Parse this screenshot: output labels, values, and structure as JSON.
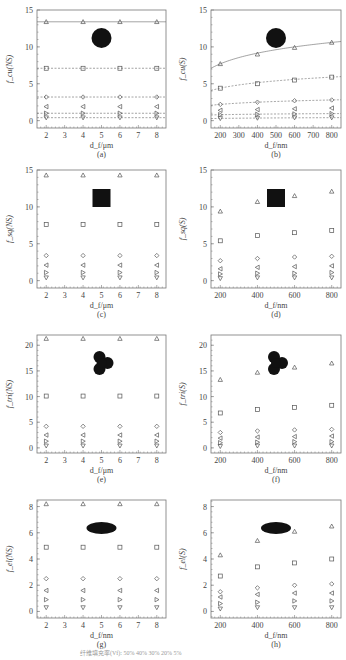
{
  "figure": {
    "legend_text": "纤维填充率(Vf): 50%  40%  30%  20%  5%"
  },
  "chart_data": [
    {
      "id": "a",
      "type": "scatter",
      "label": "(a)",
      "ylabel": "f_cu(NS)",
      "xlabel": "d_f/μm",
      "shape": "circle",
      "xlim": [
        1.5,
        8.5
      ],
      "ylim": [
        -1,
        15
      ],
      "xticks": [
        2,
        3,
        4,
        5,
        6,
        7,
        8
      ],
      "yticks": [
        0,
        5,
        10,
        15
      ],
      "x": [
        2,
        4,
        6,
        8
      ],
      "series": [
        {
          "marker": "triangle-up",
          "values": [
            13.4,
            13.4,
            13.4,
            13.4
          ],
          "line": "solid"
        },
        {
          "marker": "square",
          "values": [
            7.1,
            7.1,
            7.1,
            7.1
          ],
          "line": "dashed"
        },
        {
          "marker": "diamond",
          "values": [
            3.2,
            3.2,
            3.2,
            3.2
          ],
          "line": "dashed"
        },
        {
          "marker": "triangle-left",
          "values": [
            1.9,
            1.9,
            1.9,
            1.9
          ],
          "line": "none"
        },
        {
          "marker": "triangle-right",
          "values": [
            1.0,
            1.0,
            1.0,
            1.0
          ],
          "line": "dashed"
        },
        {
          "marker": "triangle-down",
          "values": [
            0.4,
            0.4,
            0.4,
            0.4
          ],
          "line": "dashed"
        }
      ]
    },
    {
      "id": "b",
      "type": "scatter",
      "label": "(b)",
      "ylabel": "f_cu(S)",
      "xlabel": "d_f/nm",
      "shape": "circle",
      "xlim": [
        150,
        850
      ],
      "ylim": [
        -1,
        15
      ],
      "xticks": [
        200,
        300,
        400,
        500,
        600,
        700,
        800
      ],
      "yticks": [
        0,
        5,
        10,
        15
      ],
      "x": [
        200,
        400,
        600,
        800
      ],
      "series": [
        {
          "marker": "triangle-up",
          "values": [
            7.7,
            9.0,
            9.9,
            10.6
          ],
          "line": "solid"
        },
        {
          "marker": "square",
          "values": [
            4.4,
            5.0,
            5.5,
            5.9
          ],
          "line": "dashed"
        },
        {
          "marker": "diamond",
          "values": [
            2.2,
            2.5,
            2.7,
            2.8
          ],
          "line": "dashed"
        },
        {
          "marker": "triangle-left",
          "values": [
            1.4,
            1.5,
            1.6,
            1.7
          ],
          "line": "none"
        },
        {
          "marker": "triangle-right",
          "values": [
            0.8,
            0.85,
            0.9,
            0.95
          ],
          "line": "dashed"
        },
        {
          "marker": "triangle-down",
          "values": [
            0.3,
            0.35,
            0.4,
            0.4
          ],
          "line": "dashed"
        }
      ]
    },
    {
      "id": "c",
      "type": "scatter",
      "label": "(c)",
      "ylabel": "f_sq(NS)",
      "xlabel": "d_f/μm",
      "shape": "square",
      "xlim": [
        1.5,
        8.5
      ],
      "ylim": [
        -1,
        15
      ],
      "xticks": [
        2,
        3,
        4,
        5,
        6,
        7,
        8
      ],
      "yticks": [
        0,
        5,
        10,
        15
      ],
      "x": [
        2,
        4,
        6,
        8
      ],
      "series": [
        {
          "marker": "triangle-up",
          "values": [
            14.3,
            14.3,
            14.3,
            14.3
          ]
        },
        {
          "marker": "square",
          "values": [
            7.6,
            7.6,
            7.6,
            7.6
          ]
        },
        {
          "marker": "diamond",
          "values": [
            3.4,
            3.4,
            3.4,
            3.4
          ]
        },
        {
          "marker": "triangle-left",
          "values": [
            2.1,
            2.1,
            2.1,
            2.1
          ]
        },
        {
          "marker": "triangle-right",
          "values": [
            1.1,
            1.1,
            1.1,
            1.1
          ]
        },
        {
          "marker": "triangle-down",
          "values": [
            0.4,
            0.4,
            0.4,
            0.4
          ]
        }
      ]
    },
    {
      "id": "d",
      "type": "scatter",
      "label": "(d)",
      "ylabel": "f_sq(S)",
      "xlabel": "d_f/nm",
      "shape": "square",
      "xlim": [
        150,
        850
      ],
      "ylim": [
        -1,
        15
      ],
      "xticks": [
        200,
        400,
        600,
        800
      ],
      "yticks": [
        0,
        5,
        10,
        15
      ],
      "x": [
        200,
        400,
        600,
        800
      ],
      "series": [
        {
          "marker": "triangle-up",
          "values": [
            9.4,
            10.7,
            11.5,
            12.1
          ]
        },
        {
          "marker": "square",
          "values": [
            5.4,
            6.1,
            6.5,
            6.8
          ]
        },
        {
          "marker": "diamond",
          "values": [
            2.7,
            3.0,
            3.2,
            3.3
          ]
        },
        {
          "marker": "triangle-left",
          "values": [
            1.6,
            1.8,
            1.9,
            2.0
          ]
        },
        {
          "marker": "triangle-right",
          "values": [
            0.9,
            1.0,
            1.0,
            1.1
          ]
        },
        {
          "marker": "triangle-down",
          "values": [
            0.3,
            0.4,
            0.4,
            0.4
          ]
        }
      ]
    },
    {
      "id": "e",
      "type": "scatter",
      "label": "(e)",
      "ylabel": "f_tri(NS)",
      "xlabel": "d_f/μm",
      "shape": "trilobal",
      "xlim": [
        1.5,
        8.5
      ],
      "ylim": [
        -1,
        22
      ],
      "xticks": [
        2,
        3,
        4,
        5,
        6,
        7,
        8
      ],
      "yticks": [
        0,
        5,
        10,
        15,
        20
      ],
      "x": [
        2,
        4,
        6,
        8
      ],
      "series": [
        {
          "marker": "triangle-up",
          "values": [
            21.3,
            21.3,
            21.3,
            21.3
          ]
        },
        {
          "marker": "square",
          "values": [
            10.1,
            10.1,
            10.1,
            10.1
          ]
        },
        {
          "marker": "diamond",
          "values": [
            4.2,
            4.2,
            4.2,
            4.2
          ]
        },
        {
          "marker": "triangle-left",
          "values": [
            2.5,
            2.5,
            2.5,
            2.5
          ]
        },
        {
          "marker": "triangle-right",
          "values": [
            1.3,
            1.3,
            1.3,
            1.3
          ]
        },
        {
          "marker": "triangle-down",
          "values": [
            0.4,
            0.4,
            0.4,
            0.4
          ]
        }
      ]
    },
    {
      "id": "f",
      "type": "scatter",
      "label": "(f)",
      "ylabel": "f_tri(S)",
      "xlabel": "d_f/nm",
      "shape": "trilobal",
      "xlim": [
        150,
        850
      ],
      "ylim": [
        -1,
        22
      ],
      "xticks": [
        200,
        400,
        600,
        800
      ],
      "yticks": [
        0,
        5,
        10,
        15,
        20
      ],
      "x": [
        200,
        400,
        600,
        800
      ],
      "series": [
        {
          "marker": "triangle-up",
          "values": [
            13.3,
            14.7,
            15.7,
            16.5
          ]
        },
        {
          "marker": "square",
          "values": [
            6.8,
            7.5,
            7.9,
            8.3
          ]
        },
        {
          "marker": "diamond",
          "values": [
            3.0,
            3.3,
            3.5,
            3.6
          ]
        },
        {
          "marker": "triangle-left",
          "values": [
            1.9,
            2.1,
            2.2,
            2.3
          ]
        },
        {
          "marker": "triangle-right",
          "values": [
            1.0,
            1.1,
            1.2,
            1.2
          ]
        },
        {
          "marker": "triangle-down",
          "values": [
            0.3,
            0.4,
            0.4,
            0.4
          ]
        }
      ]
    },
    {
      "id": "g",
      "type": "scatter",
      "label": "(g)",
      "ylabel": "f_el(NS)",
      "xlabel": "d_f/nm",
      "shape": "ellipse",
      "xlim": [
        1.5,
        8.5
      ],
      "ylim": [
        -0.5,
        8.5
      ],
      "xticks": [
        2,
        3,
        4,
        5,
        6,
        7,
        8
      ],
      "yticks": [
        0,
        2,
        4,
        6,
        8
      ],
      "x": [
        2,
        4,
        6,
        8
      ],
      "series": [
        {
          "marker": "triangle-up",
          "values": [
            8.2,
            8.2,
            8.2,
            8.2
          ]
        },
        {
          "marker": "square",
          "values": [
            4.9,
            4.9,
            4.9,
            4.9
          ]
        },
        {
          "marker": "diamond",
          "values": [
            2.5,
            2.5,
            2.5,
            2.5
          ]
        },
        {
          "marker": "triangle-left",
          "values": [
            1.6,
            1.6,
            1.6,
            1.6
          ]
        },
        {
          "marker": "triangle-right",
          "values": [
            0.9,
            0.9,
            0.9,
            0.9
          ]
        },
        {
          "marker": "triangle-down",
          "values": [
            0.3,
            0.3,
            0.3,
            0.3
          ]
        }
      ]
    },
    {
      "id": "h",
      "type": "scatter",
      "label": "(h)",
      "ylabel": "f_el(S)",
      "xlabel": "d_f/nm",
      "shape": "ellipse",
      "xlim": [
        150,
        850
      ],
      "ylim": [
        -0.5,
        8.5
      ],
      "xticks": [
        200,
        400,
        600,
        800
      ],
      "yticks": [
        0,
        2,
        4,
        6,
        8
      ],
      "x": [
        200,
        400,
        600,
        800
      ],
      "series": [
        {
          "marker": "triangle-up",
          "values": [
            4.3,
            5.4,
            6.1,
            6.5
          ]
        },
        {
          "marker": "square",
          "values": [
            2.7,
            3.4,
            3.7,
            4.0
          ]
        },
        {
          "marker": "diamond",
          "values": [
            1.5,
            1.8,
            2.0,
            2.1
          ]
        },
        {
          "marker": "triangle-left",
          "values": [
            1.1,
            1.3,
            1.4,
            1.4
          ]
        },
        {
          "marker": "triangle-right",
          "values": [
            0.6,
            0.7,
            0.8,
            0.8
          ]
        },
        {
          "marker": "triangle-down",
          "values": [
            0.2,
            0.3,
            0.3,
            0.3
          ]
        }
      ]
    }
  ]
}
